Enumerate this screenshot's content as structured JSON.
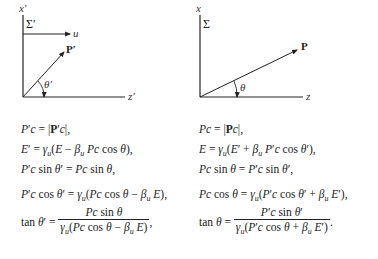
{
  "left_frame": {
    "frame_label": "Σ′",
    "vertical_axis_label": "x′",
    "horizontal_axis_label": "z′",
    "velocity_label": "u",
    "vector_label": "P′",
    "angle_label": "θ′"
  },
  "right_frame": {
    "frame_label": "Σ",
    "vertical_axis_label": "x",
    "horizontal_axis_label": "z",
    "vector_label": "P",
    "angle_label": "θ"
  },
  "left_equations": [
    "P′c = |P′c|,",
    "E′ = γu(E − βu Pc cos θ),",
    "P′c sin θ′ = Pc sin θ,",
    "P′c cos θ′ = γu(Pc cos θ − βu E),",
    "tan θ′ = Pc sin θ / γu(Pc cos θ − βu E),"
  ],
  "right_equations": [
    "Pc = |Pc|,",
    "E = γu(E′ + βu P′c cos θ′),",
    "Pc sin θ = P′c sin θ′,",
    "Pc cos θ = γu(P′c cos θ′ + βu E′),",
    "tan θ = P′c sin θ′ / γu(P′c cos θ + βu E′)."
  ],
  "colors": {
    "ink": "#222222",
    "background": "#ffffff"
  }
}
